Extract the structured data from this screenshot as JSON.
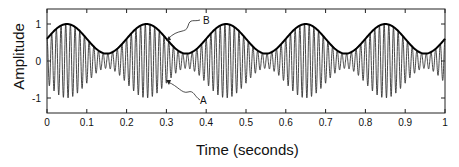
{
  "chart_data": {
    "type": "line",
    "title": "",
    "xlabel": "Time (seconds)",
    "ylabel": "Amplitude",
    "xlim": [
      0,
      1
    ],
    "ylim": [
      -1.4,
      1.4
    ],
    "x_ticks": [
      "0",
      "0.1",
      "0.2",
      "0.3",
      "0.4",
      "0.5",
      "0.6",
      "0.7",
      "0.8",
      "0.9",
      "1"
    ],
    "y_ticks": [
      "1",
      "0",
      "-1"
    ],
    "grid": false,
    "legend": null,
    "series": [
      {
        "name": "A",
        "description": "AM signal: B(t)·cos(2π·85·t)",
        "carrier_hz": 85,
        "color": "#333333"
      },
      {
        "name": "B",
        "description": "Envelope: 0.6 + 0.4·sin(2π·5·t)",
        "offset": 0.6,
        "amplitude": 0.4,
        "freq_hz": 5,
        "color": "#000000",
        "x": [
          0,
          0.05,
          0.1,
          0.15,
          0.2,
          0.25,
          0.3,
          0.35,
          0.4,
          0.45,
          0.5,
          0.55,
          0.6,
          0.65,
          0.7,
          0.75,
          0.8,
          0.85,
          0.9,
          0.95,
          1.0
        ],
        "y": [
          0.6,
          1.0,
          0.6,
          0.2,
          0.6,
          1.0,
          0.6,
          0.2,
          0.6,
          1.0,
          0.6,
          0.2,
          0.6,
          1.0,
          0.6,
          0.2,
          0.6,
          1.0,
          0.6,
          0.2,
          0.6
        ]
      }
    ],
    "annotations": [
      {
        "label": "B",
        "points_to": "envelope",
        "at_x": 0.3
      },
      {
        "label": "A",
        "points_to": "signal",
        "at_x": 0.305
      }
    ]
  }
}
